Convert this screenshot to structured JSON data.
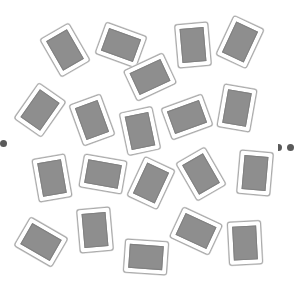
{
  "game": {
    "name": "Face-down card layout",
    "card_count": 20,
    "card_face": "back",
    "colors": {
      "background": "#ffffff",
      "card_border": "#a9a9a9",
      "card_back": "#8e8e8e",
      "marker": "#5a5a5a"
    }
  },
  "cards": [
    {
      "id": 1,
      "orientation": "portrait",
      "rotation_deg": -30
    },
    {
      "id": 2,
      "orientation": "landscape",
      "rotation_deg": 20
    },
    {
      "id": 3,
      "orientation": "portrait",
      "rotation_deg": -5
    },
    {
      "id": 4,
      "orientation": "portrait",
      "rotation_deg": 25
    },
    {
      "id": 5,
      "orientation": "landscape",
      "rotation_deg": -25
    },
    {
      "id": 6,
      "orientation": "portrait",
      "rotation_deg": 35
    },
    {
      "id": 7,
      "orientation": "portrait",
      "rotation_deg": -20
    },
    {
      "id": 8,
      "orientation": "portrait",
      "rotation_deg": -12
    },
    {
      "id": 9,
      "orientation": "landscape",
      "rotation_deg": -20
    },
    {
      "id": 10,
      "orientation": "portrait",
      "rotation_deg": 10
    },
    {
      "id": 11,
      "orientation": "portrait",
      "rotation_deg": -10
    },
    {
      "id": 12,
      "orientation": "landscape",
      "rotation_deg": 10
    },
    {
      "id": 13,
      "orientation": "portrait",
      "rotation_deg": 25
    },
    {
      "id": 14,
      "orientation": "portrait",
      "rotation_deg": -30
    },
    {
      "id": 15,
      "orientation": "portrait",
      "rotation_deg": 5
    },
    {
      "id": 16,
      "orientation": "landscape",
      "rotation_deg": 30
    },
    {
      "id": 17,
      "orientation": "portrait",
      "rotation_deg": -5
    },
    {
      "id": 18,
      "orientation": "landscape",
      "rotation_deg": 4
    },
    {
      "id": 19,
      "orientation": "landscape",
      "rotation_deg": 25
    },
    {
      "id": 20,
      "orientation": "portrait",
      "rotation_deg": -3
    }
  ],
  "markers": [
    {
      "id": "left",
      "count": 1
    },
    {
      "id": "right",
      "count": 2
    }
  ]
}
